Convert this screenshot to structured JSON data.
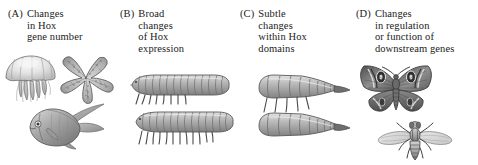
{
  "figure": {
    "background_color": "#ffffff",
    "ink_color": "#1a1a1a",
    "art_style": "grayscale-stipple-engraving"
  },
  "panels": [
    {
      "id": "A",
      "tag": "(A)",
      "caption": "Changes\nin Hox\ngene number",
      "caption_lines": [
        "Changes",
        "in Hox",
        "gene number"
      ],
      "organisms": [
        {
          "name": "jellyfish",
          "label": "jellyfish"
        },
        {
          "name": "starfish",
          "label": "sea star"
        },
        {
          "name": "angelfish",
          "label": "angelfish"
        }
      ]
    },
    {
      "id": "B",
      "tag": "(B)",
      "caption": "Broad\nchanges\nof Hox\nexpression",
      "caption_lines": [
        "Broad",
        "changes",
        "of Hox",
        "expression"
      ],
      "organisms": [
        {
          "name": "segmented-larva-few-legs",
          "label": "larva with fewer leg pairs",
          "leg_pairs": 8
        },
        {
          "name": "segmented-larva-many-legs",
          "label": "larva with more leg pairs",
          "leg_pairs": 12
        }
      ]
    },
    {
      "id": "C",
      "tag": "(C)",
      "caption": "Subtle\nchanges\nwithin Hox\ndomains",
      "caption_lines": [
        "Subtle",
        "changes",
        "within Hox",
        "domains"
      ],
      "organisms": [
        {
          "name": "tapered-larva-with-legs",
          "label": "larva with legs",
          "leg_pairs": 5
        },
        {
          "name": "tapered-larva-legless",
          "label": "legless larva",
          "leg_pairs": 0
        }
      ]
    },
    {
      "id": "D",
      "tag": "(D)",
      "caption": "Changes\nin regulation\nor function of\ndownstream genes",
      "caption_lines": [
        "Changes",
        "in regulation",
        "or function of",
        "downstream genes"
      ],
      "organisms": [
        {
          "name": "moth",
          "label": "moth with eyespots"
        },
        {
          "name": "fly",
          "label": "fly"
        }
      ]
    }
  ]
}
